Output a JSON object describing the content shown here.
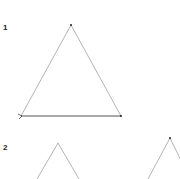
{
  "steps": [
    {
      "label": "1",
      "x": 3,
      "y": 23
    },
    {
      "label": "2",
      "x": 3,
      "y": 143
    }
  ],
  "colors": {
    "line": "#9a9a9a",
    "base_line": "#555555",
    "point": "#222222"
  },
  "figure1": {
    "apex": [
      71,
      25
    ],
    "left": [
      21,
      116
    ],
    "right": [
      121,
      116
    ]
  },
  "figure2a": {
    "apex": [
      58,
      143
    ],
    "left": [
      37,
      179
    ],
    "right": [
      79,
      179
    ]
  },
  "figure2b": {
    "apex": [
      170,
      138
    ],
    "left": [
      148,
      179
    ],
    "right": [
      190,
      179
    ]
  }
}
